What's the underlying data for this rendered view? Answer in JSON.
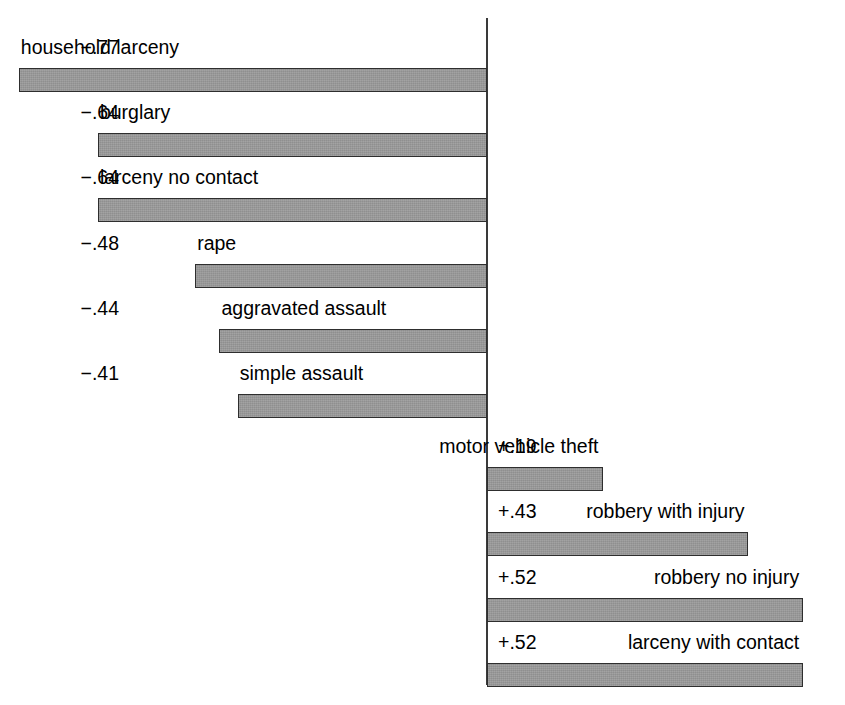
{
  "chart_data": {
    "type": "bar",
    "orientation": "horizontal",
    "title": "",
    "subtitle": "",
    "xlabel": "",
    "ylabel": "",
    "grid": false,
    "legend": null,
    "zero_axis": true,
    "xlim": [
      -0.8,
      0.56
    ],
    "note": "Diverging horizontal bar chart; negative values extend left of the zero axis, positive values extend right. Each bar is labeled above with its category name and signed value.",
    "categories": [
      "household larceny",
      "burglary",
      "larceny no contact",
      "rape",
      "aggravated assault",
      "simple assault",
      "motor vehicle theft",
      "robbery with injury",
      "robbery no injury",
      "larceny with contact"
    ],
    "values": [
      -0.77,
      -0.64,
      -0.64,
      -0.48,
      -0.44,
      -0.41,
      0.19,
      0.43,
      0.52,
      0.52
    ],
    "value_labels": [
      "−.77",
      "−.64",
      "−.64",
      "−.48",
      "−.44",
      "−.41",
      "+.19",
      "+.43",
      "+.52",
      "+.52"
    ],
    "bars": [
      {
        "name": "household larceny",
        "value": -0.77,
        "value_label": "−.77",
        "side": "negative"
      },
      {
        "name": "burglary",
        "value": -0.64,
        "value_label": "−.64",
        "side": "negative"
      },
      {
        "name": "larceny no contact",
        "value": -0.64,
        "value_label": "−.64",
        "side": "negative"
      },
      {
        "name": "rape",
        "value": -0.48,
        "value_label": "−.48",
        "side": "negative"
      },
      {
        "name": "aggravated assault",
        "value": -0.44,
        "value_label": "−.44",
        "side": "negative"
      },
      {
        "name": "simple assault",
        "value": -0.41,
        "value_label": "−.41",
        "side": "negative"
      },
      {
        "name": "motor vehicle theft",
        "value": 0.19,
        "value_label": "+.19",
        "side": "positive"
      },
      {
        "name": "robbery with injury",
        "value": 0.43,
        "value_label": "+.43",
        "side": "positive"
      },
      {
        "name": "robbery no injury",
        "value": 0.52,
        "value_label": "+.52",
        "side": "positive"
      },
      {
        "name": "larceny with contact",
        "value": 0.52,
        "value_label": "+.52",
        "side": "positive"
      }
    ]
  },
  "colors": {
    "bar_fill": "#8f8f8f",
    "bar_border": "#2e2e2e",
    "axis": "#3a3a3a",
    "text": "#000000",
    "background": "#ffffff"
  }
}
